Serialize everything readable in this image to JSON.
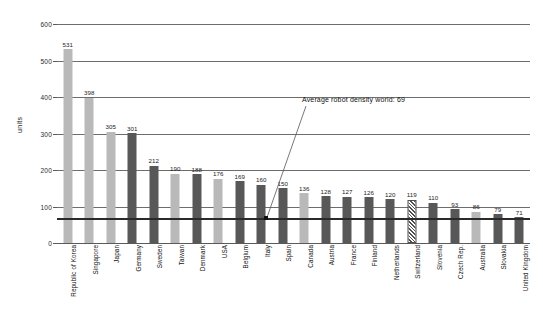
{
  "chart_data": {
    "type": "bar",
    "title": "",
    "xlabel": "",
    "ylabel": "units",
    "ylim": [
      0,
      600
    ],
    "yticks": [
      0,
      100,
      200,
      300,
      400,
      500,
      600
    ],
    "grid": true,
    "legend": "none",
    "categories": [
      "Republic of Korea",
      "Singapore",
      "Japan",
      "Germany",
      "Sweden",
      "Taiwan",
      "Denmark",
      "USA",
      "Belgium",
      "Italy",
      "Spain",
      "Canada",
      "Austria",
      "France",
      "Finland",
      "Netherlands",
      "Switzerland",
      "Slovenia",
      "Czech Rep.",
      "Australia",
      "Slovakia",
      "United Kingdom"
    ],
    "values": [
      531,
      398,
      305,
      301,
      212,
      190,
      188,
      176,
      169,
      160,
      150,
      136,
      128,
      127,
      126,
      120,
      119,
      110,
      93,
      86,
      79,
      71
    ],
    "bar_styles": [
      "light",
      "light",
      "light",
      "dark",
      "dark",
      "light",
      "dark",
      "light",
      "dark",
      "dark",
      "dark",
      "light",
      "dark",
      "dark",
      "dark",
      "dark",
      "hatch",
      "dark",
      "dark",
      "light",
      "dark",
      "dark"
    ],
    "reference_line": {
      "value": 69,
      "label": "Average robot density world: 69"
    },
    "colors": {
      "light_bar": "#b9b9b9",
      "dark_bar": "#585858",
      "grid": "#6d6d6d",
      "reference": "#2a2a2a",
      "text": "#1c1c1c",
      "background": "#ffffff"
    }
  }
}
